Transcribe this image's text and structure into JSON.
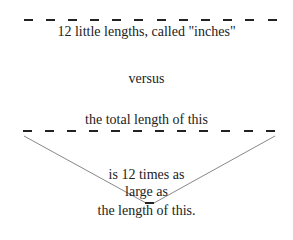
{
  "diagram": {
    "top_label": "12 little lengths, called \"inches\"",
    "middle_label": "versus",
    "bottom_top_label": "the total length of this",
    "comparison_line1": "is 12 times as",
    "comparison_line2": "large as",
    "comparison_line3": "the length of this.",
    "top_dashes": 12,
    "bottom_dashes": 12,
    "colors": {
      "dash": "#222222",
      "diagonal": "#888888",
      "text": "#222222"
    }
  }
}
